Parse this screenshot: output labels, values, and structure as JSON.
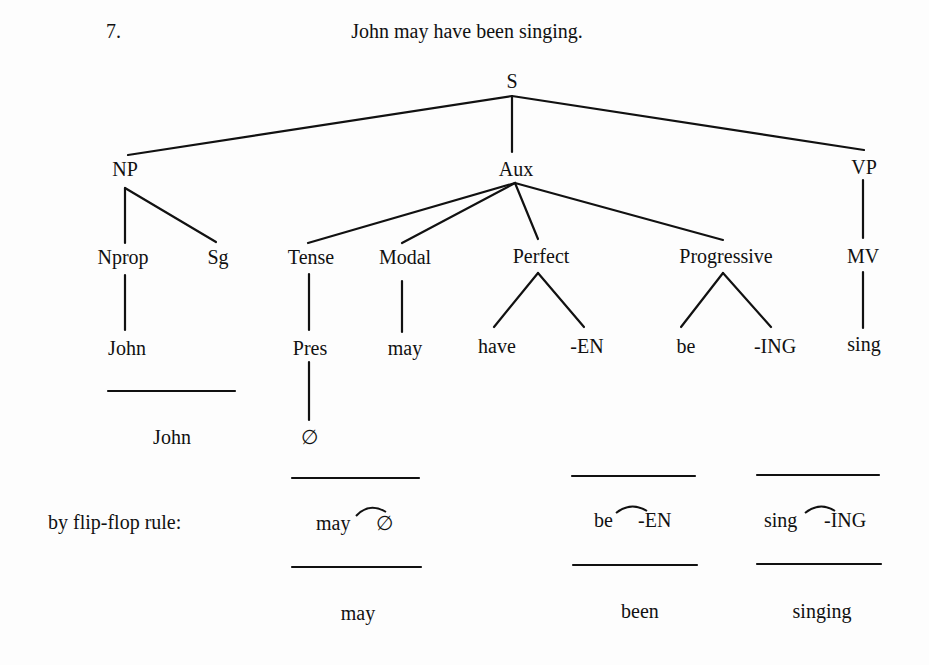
{
  "example": {
    "number": "7.",
    "sentence": "John may have been singing."
  },
  "tree": {
    "root": "S",
    "level1": {
      "np": "NP",
      "aux": "Aux",
      "vp": "VP"
    },
    "level2": {
      "nprop": "Nprop",
      "sg": "Sg",
      "tense": "Tense",
      "modal": "Modal",
      "perfect": "Perfect",
      "progressive": "Progressive",
      "mv": "MV"
    },
    "level3": {
      "john": "John",
      "pres": "Pres",
      "may": "may",
      "have": "have",
      "en": "-EN",
      "be": "be",
      "ing": "-ING",
      "sing": "sing"
    },
    "level4": {
      "john": "John",
      "zero": "∅"
    }
  },
  "flipflop": {
    "label": "by flip-flop rule:",
    "pairs": [
      {
        "left": "may",
        "right": "∅",
        "result": "may"
      },
      {
        "left": "be",
        "right": "-EN",
        "result": "been"
      },
      {
        "left": "sing",
        "right": "-ING",
        "result": "singing"
      }
    ]
  }
}
